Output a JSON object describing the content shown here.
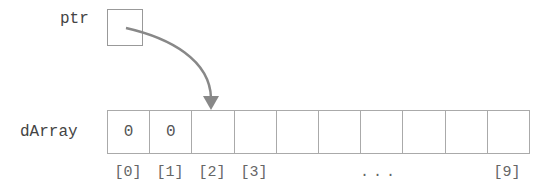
{
  "pointer": {
    "name": "ptr"
  },
  "array": {
    "name": "dArray",
    "cells": [
      "0",
      "0",
      "",
      "",
      "",
      "",
      "",
      "",
      "",
      ""
    ],
    "indices": [
      {
        "label": "[0]",
        "cell": 0
      },
      {
        "label": "[1]",
        "cell": 1
      },
      {
        "label": "[2]",
        "cell": 2
      },
      {
        "label": "[3]",
        "cell": 3
      },
      {
        "label": "[9]",
        "cell": 9
      }
    ],
    "ellipsis": "..."
  },
  "arrow": {
    "from": "ptr",
    "to_index": 2,
    "color": "#888888"
  }
}
